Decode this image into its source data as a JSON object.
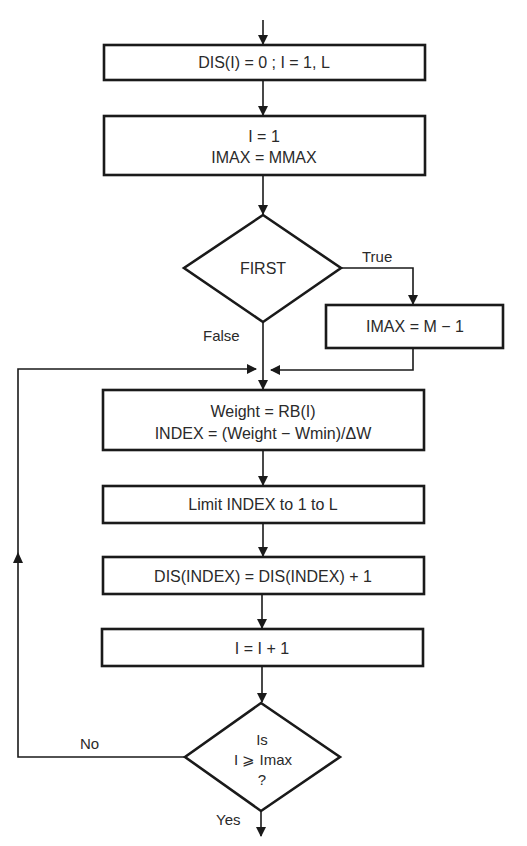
{
  "diagram": {
    "type": "flowchart",
    "nodes": [
      {
        "id": "init-dis",
        "shape": "process",
        "lines": [
          "DIS(I) = 0 ; I = 1, L"
        ]
      },
      {
        "id": "init-i",
        "shape": "process",
        "lines": [
          "I = 1",
          "IMAX = MMAX"
        ]
      },
      {
        "id": "first-decision",
        "shape": "decision",
        "lines": [
          "FIRST"
        ]
      },
      {
        "id": "set-imax",
        "shape": "process",
        "lines": [
          "IMAX = M − 1"
        ]
      },
      {
        "id": "compute-index",
        "shape": "process",
        "lines": [
          "Weight = RB(I)",
          "INDEX = (Weight − Wmin)/ΔW"
        ]
      },
      {
        "id": "limit-index",
        "shape": "process",
        "lines": [
          "Limit INDEX to 1 to L"
        ]
      },
      {
        "id": "increment-dis",
        "shape": "process",
        "lines": [
          "DIS(INDEX) = DIS(INDEX) + 1"
        ]
      },
      {
        "id": "increment-i",
        "shape": "process",
        "lines": [
          "I = I + 1"
        ]
      },
      {
        "id": "loop-decision",
        "shape": "decision",
        "lines": [
          "Is",
          "I ⩾ Imax",
          "?"
        ]
      }
    ],
    "edge_labels": {
      "true": "True",
      "false": "False",
      "no": "No",
      "yes": "Yes"
    }
  }
}
